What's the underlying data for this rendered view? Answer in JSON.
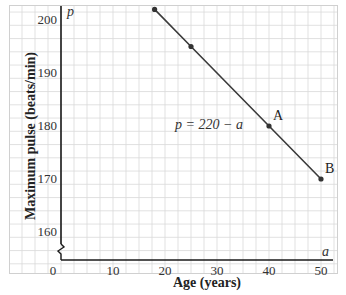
{
  "chart_data": {
    "type": "line",
    "title": "",
    "xlabel": "Age (years)",
    "ylabel": "Maximum pulse  (beats/min)",
    "x_axis_var": "a",
    "y_axis_var": "p",
    "xlim": [
      0,
      50
    ],
    "ylim": [
      155,
      202
    ],
    "x_ticks": [
      0,
      10,
      20,
      30,
      40,
      50
    ],
    "x_tick_labels": [
      "0",
      "10",
      "20",
      "30",
      "40",
      "50"
    ],
    "y_ticks": [
      160,
      170,
      180,
      190,
      200
    ],
    "y_tick_labels": [
      "160",
      "170",
      "180",
      "190",
      "200"
    ],
    "grid": true,
    "y_axis_break": true,
    "equation_label": "p = 220 − a",
    "series": [
      {
        "name": "p = 220 - a",
        "x": [
          18,
          25,
          40,
          50
        ],
        "y": [
          202,
          195,
          180,
          170
        ],
        "point_labels": [
          "",
          "",
          "A",
          "B"
        ]
      }
    ],
    "colors": {
      "line": "#3a3a3a",
      "grid": "#d9d9d9",
      "axis": "#1a1a1a"
    }
  }
}
